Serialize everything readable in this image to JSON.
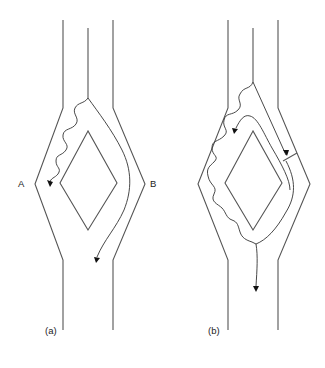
{
  "figure": {
    "panels": [
      {
        "id": "a",
        "caption": "(a)",
        "side_labels": {
          "left": "A",
          "right": "B"
        }
      },
      {
        "id": "b",
        "caption": "(b)"
      }
    ],
    "colors": {
      "wall": "#555555",
      "path": "#333333",
      "arrow": "#111111"
    }
  }
}
